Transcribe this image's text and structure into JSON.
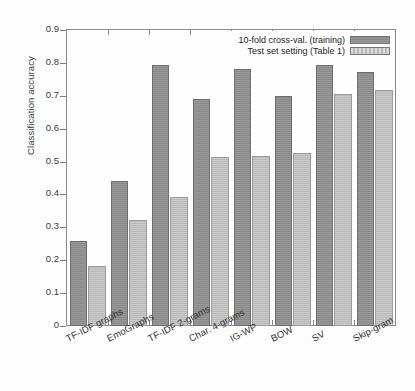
{
  "chart_data": {
    "type": "bar",
    "title": "",
    "xlabel": "",
    "ylabel": "Classification accuracy",
    "ylim": [
      0,
      0.9
    ],
    "ytick_labels": [
      "0",
      "0.1",
      "0.2",
      "0.3",
      "0.4",
      "0.5",
      "0.6",
      "0.7",
      "0.8",
      "0.9"
    ],
    "ytick_values": [
      0,
      0.1,
      0.2,
      0.3,
      0.4,
      0.5,
      0.6,
      0.7,
      0.8,
      0.9
    ],
    "grid": false,
    "legend_position": "top-right",
    "categories": [
      "TF-IDF graphs",
      "EmoGraphs",
      "TF-IDF 2-grams",
      "Char. 4-grams",
      "IG-WP",
      "BOW",
      "SV",
      "Skip-gram"
    ],
    "series": [
      {
        "name": "10-fold cross-val. (training)",
        "color": "#8d8d8d",
        "values": [
          0.258,
          0.441,
          0.794,
          0.69,
          0.78,
          0.699,
          0.795,
          0.772
        ]
      },
      {
        "name": "Test set setting (Table 1)",
        "color": "#bcbcbc",
        "values": [
          0.182,
          0.323,
          0.392,
          0.514,
          0.518,
          0.526,
          0.704,
          0.717
        ]
      }
    ]
  },
  "axis": {
    "y_title": "Classification accuracy"
  },
  "legend": {
    "entries": [
      {
        "label": "10-fold cross-val. (training)"
      },
      {
        "label": "Test set setting (Table 1)"
      }
    ]
  }
}
